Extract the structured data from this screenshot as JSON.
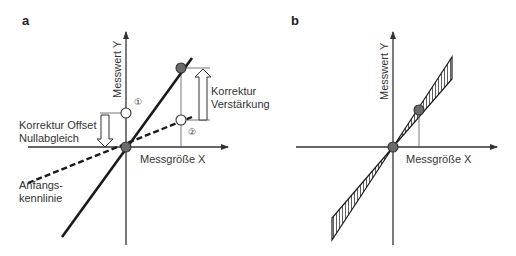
{
  "figure": {
    "panels": [
      {
        "id": "a",
        "letter": "a",
        "y_axis_label": "Messwert Y",
        "x_axis_label": "Messgröße X",
        "annotations": {
          "offset_correction_line1": "Korrektur Offset",
          "offset_correction_line2": "Nullabgleich",
          "gain_correction_line1": "Korrektur",
          "gain_correction_line2": "Verstärkung",
          "initial_curve_line1": "Anfangs-",
          "initial_curve_line2": "kennlinie",
          "marker_1": "①",
          "marker_2": "②"
        }
      },
      {
        "id": "b",
        "letter": "b",
        "y_axis_label": "Messwert Y",
        "x_axis_label": "Messgröße X"
      }
    ],
    "colors": {
      "line": "#1a1a1a",
      "axis": "#333333",
      "dot_fill": "#6b6b6b",
      "open_circle_fill": "#ffffff",
      "text": "#333333"
    }
  }
}
